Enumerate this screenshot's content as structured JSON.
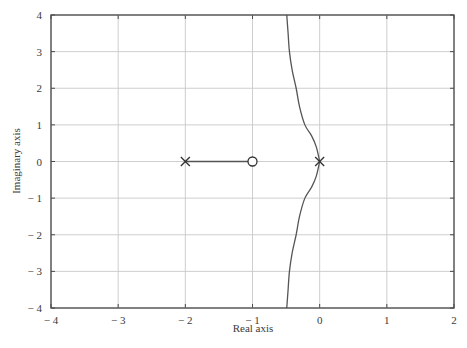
{
  "chart_data": {
    "type": "line",
    "title": "",
    "xlabel": "Real axis",
    "ylabel": "Imaginary axis",
    "xlim": [
      -4,
      2
    ],
    "ylim": [
      -4,
      4
    ],
    "grid": true,
    "legend": null,
    "x_ticks": [
      -4,
      -3,
      -2,
      -1,
      0,
      1,
      2
    ],
    "y_ticks": [
      -4,
      -3,
      -2,
      -1,
      0,
      1,
      2,
      3,
      4
    ],
    "x_tick_labels": [
      "− 4",
      "− 3",
      "− 2",
      "− 1",
      "0",
      "1",
      "2"
    ],
    "y_tick_labels": [
      "− 4",
      "− 3",
      "− 2",
      "− 1",
      "0",
      "1",
      "2",
      "3",
      "4"
    ],
    "poles": [
      {
        "re": -2,
        "im": 0
      },
      {
        "re": 0,
        "im": 0
      }
    ],
    "zeros": [
      {
        "re": -1,
        "im": 0
      }
    ],
    "series": [
      {
        "name": "real-axis branch",
        "points": [
          [
            -2,
            0
          ],
          [
            -1,
            0
          ]
        ]
      },
      {
        "name": "upper branch",
        "points": [
          [
            0,
            0
          ],
          [
            -0.05,
            0.4
          ],
          [
            -0.12,
            0.7
          ],
          [
            -0.22,
            1.0
          ],
          [
            -0.3,
            1.5
          ],
          [
            -0.35,
            2.0
          ],
          [
            -0.41,
            2.5
          ],
          [
            -0.45,
            3.0
          ],
          [
            -0.47,
            3.5
          ],
          [
            -0.49,
            4.0
          ]
        ]
      },
      {
        "name": "lower branch",
        "points": [
          [
            0,
            0
          ],
          [
            -0.05,
            -0.4
          ],
          [
            -0.12,
            -0.7
          ],
          [
            -0.22,
            -1.0
          ],
          [
            -0.3,
            -1.5
          ],
          [
            -0.35,
            -2.0
          ],
          [
            -0.41,
            -2.5
          ],
          [
            -0.45,
            -3.0
          ],
          [
            -0.47,
            -3.5
          ],
          [
            -0.49,
            -4.0
          ]
        ]
      }
    ],
    "colors": {
      "frame": "#4a4a4a",
      "grid": "#c8c8c8",
      "curve": "#555555"
    }
  }
}
